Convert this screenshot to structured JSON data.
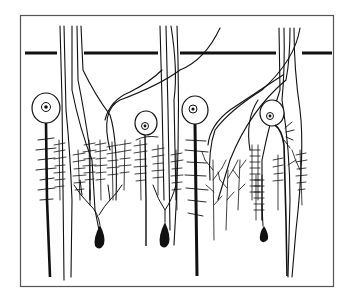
{
  "figure": {
    "title": "",
    "caption": "",
    "frame": {
      "x": 20,
      "y": 15,
      "width": 314,
      "height": 272,
      "color": "#555555"
    },
    "ink_color": "#111111",
    "background": "#ffffff",
    "limiting_line": {
      "y": 53,
      "segments": [
        [
          25,
          57
        ],
        [
          84,
          158
        ],
        [
          180,
          276
        ],
        [
          302,
          332
        ]
      ]
    },
    "cells": [
      {
        "type": "round-soma",
        "x": 46,
        "soma_y": 108,
        "r": 14,
        "axon_bottom": 277
      },
      {
        "type": "round-soma",
        "x": 146,
        "soma_y": 123,
        "r": 12,
        "axon_bottom": 246
      },
      {
        "type": "round-soma",
        "x": 195,
        "soma_y": 110,
        "r": 13,
        "axon_bottom": 276
      },
      {
        "type": "round-soma",
        "x": 272,
        "soma_y": 113,
        "r": 12,
        "axon_bottom": 276
      },
      {
        "type": "teardrop-soma",
        "x": 100,
        "soma_y": 242
      },
      {
        "type": "teardrop-soma",
        "x": 165,
        "soma_y": 241
      },
      {
        "type": "teardrop-soma",
        "x": 264,
        "soma_y": 236
      }
    ]
  }
}
